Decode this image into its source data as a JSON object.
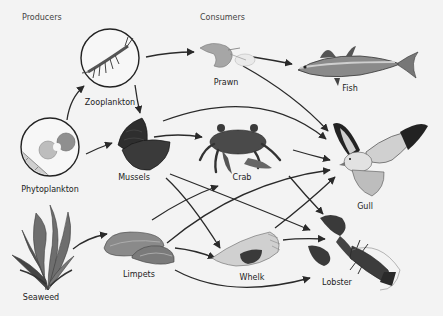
{
  "headers": {
    "producers": "Producers",
    "consumers": "Consumers"
  },
  "organisms": [
    {
      "id": "zooplankton",
      "label": "Zooplankton",
      "x": 110,
      "y": 103
    },
    {
      "id": "phytoplankton",
      "label": "Phytoplankton",
      "x": 50,
      "y": 190
    },
    {
      "id": "seaweed",
      "label": "Seaweed",
      "x": 41,
      "y": 297
    },
    {
      "id": "prawn",
      "label": "Prawn",
      "x": 226,
      "y": 83
    },
    {
      "id": "fish",
      "label": "Fish",
      "x": 350,
      "y": 88
    },
    {
      "id": "mussels",
      "label": "Mussels",
      "x": 134,
      "y": 177
    },
    {
      "id": "crab",
      "label": "Crab",
      "x": 242,
      "y": 177
    },
    {
      "id": "gull",
      "label": "Gull",
      "x": 365,
      "y": 206
    },
    {
      "id": "limpets",
      "label": "Limpets",
      "x": 139,
      "y": 274
    },
    {
      "id": "whelk",
      "label": "Whelk",
      "x": 252,
      "y": 277
    },
    {
      "id": "lobster",
      "label": "Lobster",
      "x": 337,
      "y": 282
    }
  ],
  "arrows": [
    {
      "from": "Phytoplankton",
      "to": "Zooplankton"
    },
    {
      "from": "Phytoplankton",
      "to": "Mussels"
    },
    {
      "from": "Zooplankton",
      "to": "Prawn"
    },
    {
      "from": "Zooplankton",
      "to": "Mussels"
    },
    {
      "from": "Prawn",
      "to": "Fish"
    },
    {
      "from": "Prawn",
      "to": "Gull"
    },
    {
      "from": "Mussels",
      "to": "Gull"
    },
    {
      "from": "Mussels",
      "to": "Crab"
    },
    {
      "from": "Mussels",
      "to": "Whelk"
    },
    {
      "from": "Mussels",
      "to": "Lobster"
    },
    {
      "from": "Crab",
      "to": "Gull"
    },
    {
      "from": "Crab",
      "to": "Lobster"
    },
    {
      "from": "Seaweed",
      "to": "Limpets"
    },
    {
      "from": "Limpets",
      "to": "Crab"
    },
    {
      "from": "Limpets",
      "to": "Gull"
    },
    {
      "from": "Limpets",
      "to": "Whelk"
    },
    {
      "from": "Limpets",
      "to": "Lobster"
    },
    {
      "from": "Whelk",
      "to": "Gull"
    },
    {
      "from": "Whelk",
      "to": "Lobster"
    }
  ],
  "colors": {
    "background": "#f3f3f3",
    "arrow": "#2a2a2a",
    "text": "#222222"
  }
}
